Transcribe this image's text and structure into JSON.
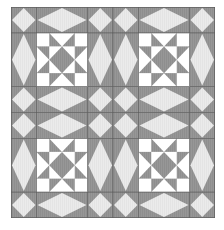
{
  "quilt": {
    "title": "Star and diamond quilt block pattern",
    "layout": {
      "block_rows": 2,
      "block_cols": 2
    },
    "colors": {
      "gray": "#8e8e8e",
      "light": "#e6e6e6",
      "white": "#ffffff",
      "seam": "#5e5e5e",
      "page": "#ffffff"
    },
    "block_elements": [
      "corner-diamond",
      "edge-diamond-horizontal",
      "edge-diamond-vertical",
      "center-star"
    ]
  }
}
